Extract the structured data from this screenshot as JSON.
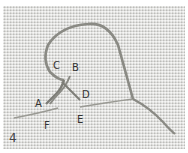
{
  "figure": {
    "step_number": "4",
    "thread_color": "#8a8a84",
    "fabric_color": "#d9d9d6"
  },
  "labels": [
    {
      "id": "A",
      "text": "A"
    },
    {
      "id": "B",
      "text": "B"
    },
    {
      "id": "C",
      "text": "C"
    },
    {
      "id": "D",
      "text": "D"
    },
    {
      "id": "E",
      "text": "E"
    },
    {
      "id": "F",
      "text": "F"
    }
  ]
}
